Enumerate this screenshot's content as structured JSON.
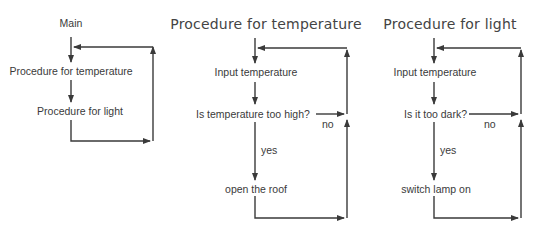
{
  "main_flow": {
    "title": "Main",
    "steps": [
      "Procedure for temperature",
      "Procedure for light"
    ]
  },
  "temperature_flow": {
    "title": "Procedure for temperature",
    "input": "Input temperature",
    "decision": "Is temperature too high?",
    "no_label": "no",
    "yes_label": "yes",
    "action": "open the roof"
  },
  "light_flow": {
    "title": "Procedure for light",
    "input": "Input temperature",
    "decision": "Is it too dark?",
    "no_label": "no",
    "yes_label": "yes",
    "action": "switch lamp on"
  },
  "colors": {
    "line": "#3a3a3a",
    "text": "#3a3a3a",
    "background": "#ffffff"
  }
}
